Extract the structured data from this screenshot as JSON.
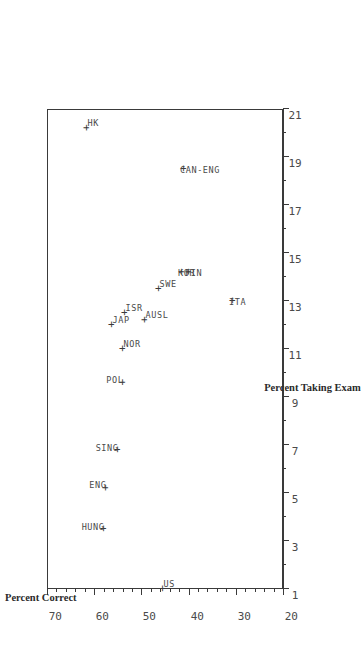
{
  "chart_data": {
    "type": "scatter",
    "title": "",
    "xlabel": "Percent Taking Exam",
    "ylabel": "Percent Correct",
    "xlim": [
      1,
      21
    ],
    "ylim": [
      20,
      70
    ],
    "xticks": [
      1,
      3,
      5,
      7,
      9,
      11,
      13,
      15,
      17,
      19,
      21
    ],
    "xtick_labels": [
      "1",
      "3",
      "5",
      "7",
      "9",
      "11",
      "13",
      "15",
      "17",
      "19",
      "21"
    ],
    "yticks": [
      20,
      30,
      40,
      50,
      60,
      70
    ],
    "ytick_labels": [
      "20",
      "30",
      "40",
      "50",
      "60",
      "70"
    ],
    "minor_ticks": true,
    "grid": false,
    "legend": null,
    "marker": "+",
    "marker_color": "#3a3a3a",
    "rotation_deg": -90,
    "points": [
      {
        "label": "HUNG",
        "x": 3.5,
        "y": 58.0,
        "label_pos": "left"
      },
      {
        "label": "ENG",
        "x": 5.2,
        "y": 57.5,
        "label_pos": "left"
      },
      {
        "label": "SING",
        "x": 6.8,
        "y": 55.0,
        "label_pos": "left"
      },
      {
        "label": "POL",
        "x": 9.6,
        "y": 54.0,
        "label_pos": "left"
      },
      {
        "label": "NOR",
        "x": 11.0,
        "y": 54.0,
        "label_pos": "right"
      },
      {
        "label": "JAP",
        "x": 12.0,
        "y": 56.2,
        "label_pos": "right"
      },
      {
        "label": "ISR",
        "x": 12.5,
        "y": 53.5,
        "label_pos": "right"
      },
      {
        "label": "AUSL",
        "x": 12.2,
        "y": 49.3,
        "label_pos": "right"
      },
      {
        "label": "SWE",
        "x": 13.5,
        "y": 46.2,
        "label_pos": "right"
      },
      {
        "label": "US",
        "x": 1.0,
        "y": 45.5,
        "label_pos": "right"
      },
      {
        "label": "KOR",
        "x": 14.2,
        "y": 41.5,
        "label_pos": "up"
      },
      {
        "label": "FIN",
        "x": 14.2,
        "y": 40.0,
        "label_pos": "up"
      },
      {
        "label": "ITA",
        "x": 13.0,
        "y": 30.5,
        "label_pos": "up"
      },
      {
        "label": "CAN-ENG",
        "x": 18.5,
        "y": 41.0,
        "label_pos": "up"
      },
      {
        "label": "HK",
        "x": 20.2,
        "y": 61.5,
        "label_pos": "right"
      }
    ]
  },
  "axes": {
    "x_title": "Percent Taking Exam",
    "y_title": "Percent Correct"
  },
  "colors": {
    "ink": "#3a3a3a",
    "text": "#4a4a4a",
    "background": "#ffffff"
  }
}
